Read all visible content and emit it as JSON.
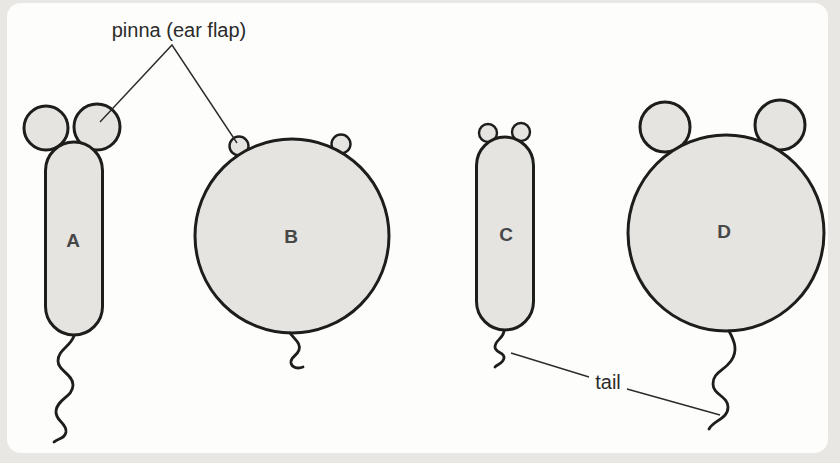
{
  "diagram": {
    "annotations": {
      "pinna": "pinna (ear flap)",
      "tail": "tail"
    },
    "organisms": [
      {
        "label": "A",
        "body": "tall narrow capsule",
        "ears": "large",
        "tail": "long wavy"
      },
      {
        "label": "B",
        "body": "large round",
        "ears": "small",
        "tail": "short wavy"
      },
      {
        "label": "C",
        "body": "tall narrow capsule",
        "ears": "small",
        "tail": "short wavy"
      },
      {
        "label": "D",
        "body": "large round",
        "ears": "large",
        "tail": "long wavy"
      }
    ],
    "colors": {
      "shape_fill": "#e5e4e1",
      "outline": "#1d1d1b",
      "annotation_text": "#2b2b2b",
      "organism_label_text": "#474747",
      "card_background": "#fdfdfc",
      "page_background": "#e8e7e3"
    }
  }
}
